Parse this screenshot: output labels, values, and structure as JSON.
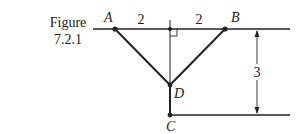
{
  "caption": {
    "line1": "Figure",
    "line2": "7.2.1"
  },
  "points": {
    "A": "A",
    "B": "B",
    "C": "C",
    "D": "D"
  },
  "dimensions": {
    "left_half": "2",
    "right_half": "2",
    "height": "3"
  },
  "colors": {
    "stroke": "#222222",
    "background": "#ffffff"
  }
}
